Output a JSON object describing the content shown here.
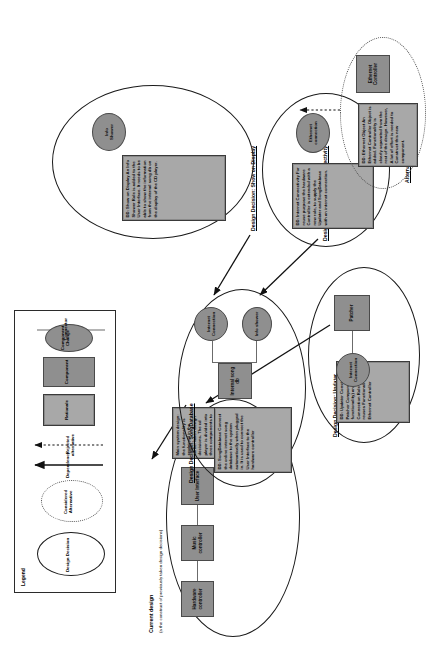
{
  "diagram": {
    "title": "Current design",
    "subtitle": "(a the construct of previously taken design decisions)"
  },
  "legend": {
    "title": "Legend",
    "items": [
      {
        "key": "design-decision",
        "label": "Design Decision",
        "shape": "solid-ellipse"
      },
      {
        "key": "considered-alternative",
        "label": "Considered\nAlternative",
        "shape": "dotted-ellipse"
      },
      {
        "key": "dependency",
        "label": "Dependency",
        "shape": "solid-arrow"
      },
      {
        "key": "rejected-alternative",
        "label": "Rejected alternative",
        "shape": "dotted-arrow"
      },
      {
        "key": "rationale",
        "label": "Rationale",
        "shape": "nested-rect"
      },
      {
        "key": "component",
        "label": "Component",
        "shape": "rect"
      },
      {
        "key": "component-change",
        "label": "Component\nChange",
        "shape": "oval"
      },
      {
        "key": "connector",
        "label": "Connector",
        "shape": "line"
      }
    ]
  },
  "current_design": {
    "components": [
      "Hardware\ncontroller",
      "Music\ncontroller",
      "User Interface"
    ],
    "rationale": "Main system design: the functionality is explained in the earlier taken design decisions. The cd player is divided into three components to be able to separate UI, music playing and decoding and hardware concerns."
  },
  "decisions": [
    {
      "id": "song-database",
      "caption": "Design Decision: SongDatabase",
      "rationale": "DD: SongDatabase\nConnect the online internet song database to the system automatically when plugged in. It is used to connect the User Interface to the hardware controller",
      "components": [
        "Internal song\ndb"
      ],
      "changes": [
        "Internet\nConnection",
        "Info shower"
      ]
    },
    {
      "id": "show-on-display",
      "caption": "Design Decision: Show on Display",
      "rationale": "DD: Show on Display\nAn Info Shower Role is added to the User Interface. It needs to be able to show the information from the internal song db on the display of the CD player.",
      "changes": [
        "Info\nShower"
      ]
    },
    {
      "id": "internet-connectivity",
      "caption": "Design Decision: Internet Connectivity",
      "rationale": "DD: Internet Connectivity\nFor reuse purpose the hardware Controller is extended with a new role, to supply the Updater and SongDatabase with an internet connection.",
      "changes": [
        "Ethernet\nconnection"
      ]
    },
    {
      "id": "updater",
      "caption": "Design Decision: Updater",
      "rationale": "DD: Updater\nConstruct a Patcher Component (new functionality) and a Internet Connection Role (which reuses Functionality from Ethernet Controller",
      "components": [
        "Patcher"
      ],
      "changes": [
        "Internet\nConnection"
      ]
    }
  ],
  "alternatives": [
    {
      "id": "ethernet-object",
      "caption": "Alternative: Ethernet Object",
      "rationale": "DD: Ethernet Object\nAn Ethernet Controller Object is added. Functionality is clearly separated from the rest of the design. However, A lot of effort is needed to Construct this new component.",
      "components": [
        "Ethernet\nController"
      ]
    }
  ]
}
